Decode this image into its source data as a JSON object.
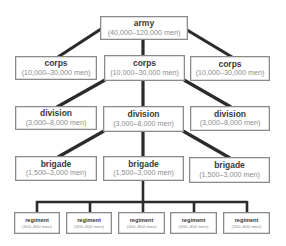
{
  "diagram": {
    "type": "military hierarchy tree",
    "colors": {
      "connector": "#2b2b2b",
      "box_border": "#8a8a8a",
      "title_text": "#3a3a3a",
      "range_text": "#8c8c8c",
      "background": "#ffffff"
    },
    "army": {
      "title": "army",
      "range": "(40,000–120,000 men)"
    },
    "corps": [
      {
        "title": "corps",
        "range": "(10,000–30,000 men)"
      },
      {
        "title": "corps",
        "range": "(10,000–30,000 men)"
      },
      {
        "title": "corps",
        "range": "(10,000–30,000 men)"
      }
    ],
    "divisions": [
      {
        "title": "division",
        "range": "(3,000–8,000 men)"
      },
      {
        "title": "division",
        "range": "(3,000–8,000 men)"
      },
      {
        "title": "division",
        "range": "(3,000–8,000 men)"
      }
    ],
    "brigades": [
      {
        "title": "brigade",
        "range": "(1,500–3,000 men)"
      },
      {
        "title": "brigade",
        "range": "(1,500–3,000 men)"
      },
      {
        "title": "brigade",
        "range": "(1,500–3,000 men)"
      }
    ],
    "regiments": [
      {
        "title": "regiment",
        "range": "(300–800 men)"
      },
      {
        "title": "regiment",
        "range": "(300–800 men)"
      },
      {
        "title": "regiment",
        "range": "(300–800 men)"
      },
      {
        "title": "regiment",
        "range": "(300–800 men)"
      },
      {
        "title": "regiment",
        "range": "(300–800 men)"
      }
    ]
  }
}
